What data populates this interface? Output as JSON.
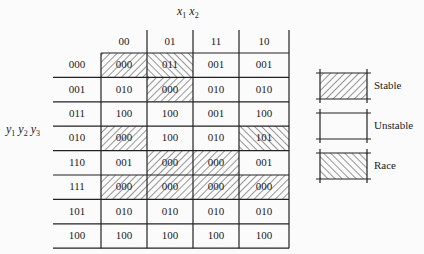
{
  "title": {
    "column_variables": "x1 x2",
    "row_variables": "y1 y2 y3"
  },
  "columns": [
    "00",
    "01",
    "11",
    "10"
  ],
  "rows": [
    {
      "label": "000",
      "cells": [
        {
          "v": "000",
          "t": "stable"
        },
        {
          "v": "011",
          "t": "race"
        },
        {
          "v": "001",
          "t": "unstable"
        },
        {
          "v": "001",
          "t": "unstable"
        }
      ]
    },
    {
      "label": "001",
      "cells": [
        {
          "v": "010",
          "t": "unstable"
        },
        {
          "v": "000",
          "t": "stable"
        },
        {
          "v": "010",
          "t": "unstable"
        },
        {
          "v": "010",
          "t": "unstable"
        }
      ]
    },
    {
      "label": "011",
      "cells": [
        {
          "v": "100",
          "t": "unstable"
        },
        {
          "v": "100",
          "t": "unstable"
        },
        {
          "v": "001",
          "t": "unstable"
        },
        {
          "v": "100",
          "t": "unstable"
        }
      ]
    },
    {
      "label": "010",
      "cells": [
        {
          "v": "000",
          "t": "stable"
        },
        {
          "v": "100",
          "t": "unstable"
        },
        {
          "v": "010",
          "t": "unstable"
        },
        {
          "v": "101",
          "t": "race"
        }
      ]
    },
    {
      "label": "110",
      "cells": [
        {
          "v": "001",
          "t": "unstable"
        },
        {
          "v": "000",
          "t": "stable"
        },
        {
          "v": "000",
          "t": "stable"
        },
        {
          "v": "001",
          "t": "unstable"
        }
      ]
    },
    {
      "label": "111",
      "cells": [
        {
          "v": "000",
          "t": "stable"
        },
        {
          "v": "000",
          "t": "stable"
        },
        {
          "v": "000",
          "t": "stable"
        },
        {
          "v": "000",
          "t": "stable"
        }
      ]
    },
    {
      "label": "101",
      "cells": [
        {
          "v": "010",
          "t": "unstable"
        },
        {
          "v": "010",
          "t": "unstable"
        },
        {
          "v": "010",
          "t": "unstable"
        },
        {
          "v": "010",
          "t": "unstable"
        }
      ]
    },
    {
      "label": "100",
      "cells": [
        {
          "v": "100",
          "t": "unstable"
        },
        {
          "v": "100",
          "t": "unstable"
        },
        {
          "v": "100",
          "t": "unstable"
        },
        {
          "v": "100",
          "t": "unstable"
        }
      ]
    }
  ],
  "legend": [
    {
      "type": "stable",
      "label": "Stable"
    },
    {
      "type": "unstable",
      "label": "Unstable"
    },
    {
      "type": "race",
      "label": "Race"
    }
  ],
  "colors": {
    "line": "#222222",
    "hatch": "#333333",
    "background": "#fbfbfb"
  }
}
